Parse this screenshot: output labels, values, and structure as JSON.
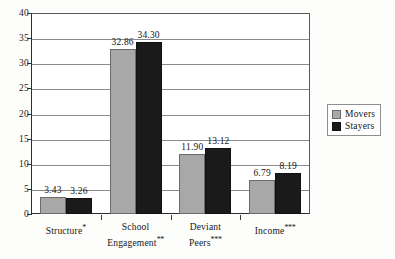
{
  "chart_data": {
    "type": "bar",
    "title": "",
    "xlabel": "",
    "ylabel": "",
    "ylim": [
      0,
      40
    ],
    "yticks": [
      0,
      5,
      10,
      15,
      20,
      25,
      30,
      35,
      40
    ],
    "grid": true,
    "legend_position": "right",
    "categories": [
      "Structure*",
      "School Engagement**",
      "Deviant Peers***",
      "Income***"
    ],
    "category_lines": [
      [
        "Structure",
        "*"
      ],
      [
        "School",
        "Engagement",
        "**"
      ],
      [
        "Deviant",
        "Peers",
        "***"
      ],
      [
        "Income",
        "***"
      ]
    ],
    "series": [
      {
        "name": "Movers",
        "color": "#a8a8a8",
        "values": [
          3.43,
          32.86,
          11.9,
          6.79
        ],
        "value_labels": [
          "3.43",
          "32.86",
          "11.90",
          "6.79"
        ]
      },
      {
        "name": "Stayers",
        "color": "#1a1a1a",
        "values": [
          3.26,
          34.3,
          13.12,
          8.19
        ],
        "value_labels": [
          "3.26",
          "34.30",
          "13.12",
          "8.19"
        ]
      }
    ]
  },
  "legend": {
    "items": [
      {
        "label": "Movers",
        "swatch": "movers"
      },
      {
        "label": "Stayers",
        "swatch": "stayers"
      }
    ]
  }
}
